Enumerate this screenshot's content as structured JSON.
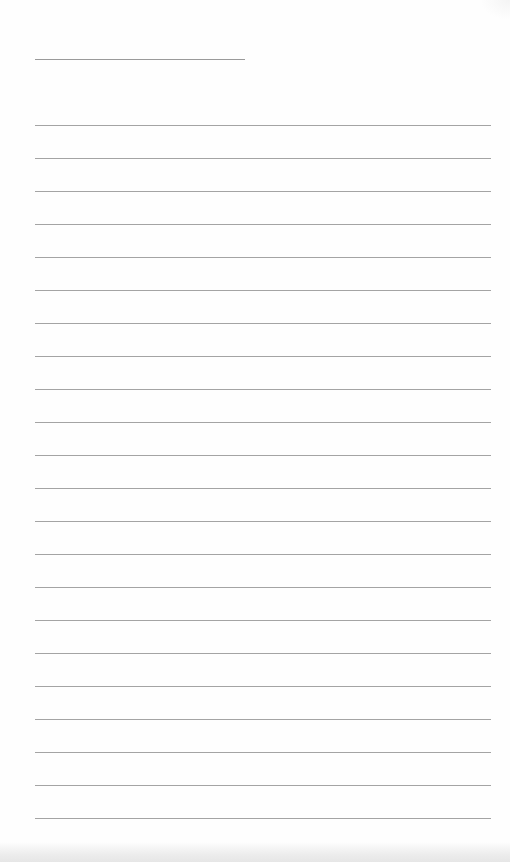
{
  "document": {
    "type": "ruled-notepad-page",
    "heading_line": {
      "left": 35,
      "top": 59,
      "width": 210
    },
    "rules": {
      "count": 22,
      "left": 35,
      "width": 456,
      "first_top": 125,
      "spacing": 33
    },
    "colors": {
      "paper": "#fefefe",
      "rule": "#a4a4a4",
      "heading_line": "#9a9a9a"
    },
    "text_lines": []
  }
}
